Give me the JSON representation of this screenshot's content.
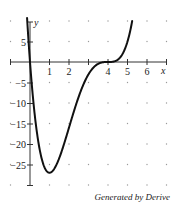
{
  "chart_data": {
    "type": "line",
    "title": "",
    "function": "f(x) = x(x - 4)^3",
    "xlabel": "x",
    "ylabel": "y",
    "xlim": [
      -1,
      7
    ],
    "ylim": [
      -30,
      10
    ],
    "x_ticks": [
      1,
      2,
      3,
      4,
      5,
      6
    ],
    "x_tick_labels": [
      "1",
      "2",
      "",
      "4",
      "5",
      "6"
    ],
    "y_ticks": [
      5,
      -5,
      -10,
      -15,
      -20,
      -25
    ],
    "y_tick_labels": [
      "5",
      "−5",
      "−10",
      "−15",
      "−20",
      "−25"
    ],
    "grid": "dots",
    "series": [
      {
        "name": "f(x)",
        "x": [
          -0.15,
          0,
          0.25,
          0.5,
          0.75,
          1,
          1.25,
          1.5,
          2,
          2.5,
          3,
          3.5,
          4,
          4.5,
          5,
          5.24
        ],
        "y": [
          10.1,
          0,
          -13.2,
          -21.4,
          -25.7,
          -27,
          -26.0,
          -23.4,
          -16,
          -8.4,
          -3,
          -0.44,
          0,
          0.56,
          5,
          10.0
        ]
      }
    ],
    "annotations": [
      "Generated by Derive"
    ]
  },
  "caption": "Generated by Derive",
  "labels": {
    "x_axis": "x",
    "y_axis": "y",
    "xt1": "1",
    "xt2": "2",
    "xt4": "4",
    "xt5": "5",
    "xt6": "6",
    "yt5": "5",
    "ytm5": "−5",
    "ytm10": "−10",
    "ytm15": "−15",
    "ytm20": "−20",
    "ytm25": "−25"
  }
}
